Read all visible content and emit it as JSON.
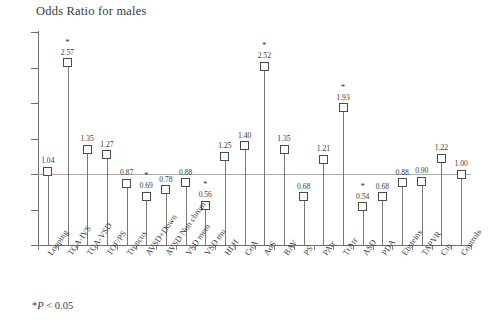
{
  "chart_data": {
    "type": "scatter",
    "title": "Odds Ratio for males",
    "xlabel": "",
    "ylabel": "",
    "ylim": [
      0,
      3
    ],
    "ytick_labels": [
      "0",
      "0.5",
      "1",
      "1.5",
      "2",
      "2.5",
      "3"
    ],
    "ytick_values": [
      0,
      0.5,
      1,
      1.5,
      2,
      2.5,
      3
    ],
    "grid": false,
    "reference_line": 1,
    "legend": "none",
    "categories": [
      "Looping",
      "TGA-IVS",
      "TGA-VSD",
      "TOF/PS",
      "Truncus",
      "AVSD+Down",
      "AVSD Non chrom",
      "VSD mem",
      "VSD mu",
      "HLH",
      "CoA",
      "AoS",
      "BAV",
      "PS",
      "PAtr",
      "TrAtr",
      "ASD",
      "PDA",
      "Ebsteins",
      "TAPVR",
      "Ctn",
      "Controls"
    ],
    "values": [
      1.04,
      2.57,
      1.35,
      1.27,
      0.87,
      0.69,
      0.78,
      0.88,
      0.56,
      1.25,
      1.4,
      2.52,
      1.35,
      0.68,
      1.21,
      1.93,
      0.54,
      0.68,
      0.88,
      0.9,
      1.22,
      1.0
    ],
    "value_labels": [
      "1.04",
      "2.57",
      "1.35",
      "1.27",
      "0.87",
      "0.69",
      "0.78",
      "0.88",
      "0.56",
      "1.25",
      "1.40",
      "2.52",
      "1.35",
      "0.68",
      "1.21",
      "1.93",
      "0.54",
      "0.68",
      "0.88",
      "0.90",
      "1.22",
      "1.00"
    ],
    "significant": [
      false,
      true,
      false,
      false,
      false,
      true,
      false,
      false,
      true,
      false,
      false,
      true,
      false,
      false,
      false,
      true,
      true,
      false,
      false,
      false,
      false,
      false
    ],
    "significance_marker": "*",
    "annotation": "*P < 0.05",
    "annotation_parts": {
      "star": "*",
      "p": "P",
      "rest": " < 0.05"
    }
  },
  "colors": {
    "axis": "#6d6d6d",
    "reference_line": "#a9a9a9",
    "marker_edge": "#4a4a4a",
    "marker_fill": "#ffffff",
    "stem": "#787878",
    "text": "#3a3a3a",
    "background": "#ffffff"
  }
}
